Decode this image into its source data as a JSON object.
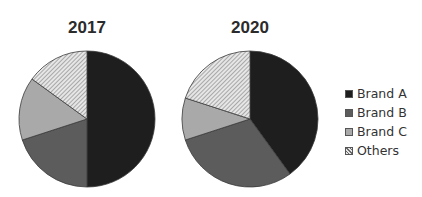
{
  "chart_data": [
    {
      "type": "pie",
      "title": "2017",
      "categories": [
        "Brand A",
        "Brand B",
        "Brand C",
        "Others"
      ],
      "values": [
        50,
        20,
        15,
        15
      ],
      "start_angle": "top, clockwise"
    },
    {
      "type": "pie",
      "title": "2020",
      "categories": [
        "Brand A",
        "Brand B",
        "Brand C",
        "Others"
      ],
      "values": [
        40,
        30,
        10,
        20
      ],
      "start_angle": "top, clockwise"
    }
  ],
  "titles": [
    "2017",
    "2020"
  ],
  "legend": {
    "position": "right",
    "items": [
      {
        "label": "Brand A",
        "color": "#1e1e1e",
        "pattern": "solid"
      },
      {
        "label": "Brand B",
        "color": "#5c5c5c",
        "pattern": "solid"
      },
      {
        "label": "Brand C",
        "color": "#a9a9a9",
        "pattern": "solid"
      },
      {
        "label": "Others",
        "color": "#e6e6e6",
        "pattern": "hatched"
      }
    ]
  }
}
